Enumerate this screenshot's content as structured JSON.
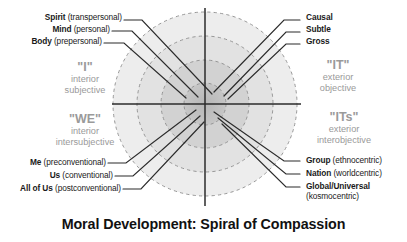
{
  "caption": "Moral Development: Spiral of Compassion",
  "colors": {
    "background": "#ffffff",
    "text": "#1a1a1a",
    "quadrant_label": "#9a9a9a",
    "axis": "#2b2b2b",
    "ring_outer": "#ededed",
    "ring_mid": "#e0e0e0",
    "ring_inner": "#cfcfcf",
    "ring_core": "#bfbfbf",
    "ring_dash": "#8a8a8a"
  },
  "quadrants": {
    "upper_left": {
      "name": "\"I\"",
      "line1": "interior",
      "line2": "subjective"
    },
    "lower_left": {
      "name": "\"WE\"",
      "line1": "interior",
      "line2": "intersubjective"
    },
    "upper_right": {
      "name": "\"IT\"",
      "line1": "exterior",
      "line2": "objective"
    },
    "lower_right": {
      "name": "\"ITs\"",
      "line1": "exterior",
      "line2": "interobjective"
    }
  },
  "labels": {
    "upper_left": [
      {
        "bold": "Spirit",
        "paren": "(transpersonal)"
      },
      {
        "bold": "Mind",
        "paren": "(personal)"
      },
      {
        "bold": "Body",
        "paren": "(prepersonal)"
      }
    ],
    "upper_right": [
      {
        "bold": "Causal",
        "paren": ""
      },
      {
        "bold": "Subtle",
        "paren": ""
      },
      {
        "bold": "Gross",
        "paren": ""
      }
    ],
    "lower_left": [
      {
        "bold": "Me",
        "paren": "(preconventional)"
      },
      {
        "bold": "Us",
        "paren": "(conventional)"
      },
      {
        "bold": "All of Us",
        "paren": "(postconventional)"
      }
    ],
    "lower_right": [
      {
        "bold": "Group",
        "paren": "(ethnocentric)"
      },
      {
        "bold": "Nation",
        "paren": "(worldcentric)"
      },
      {
        "bold": "Global/Universal",
        "paren": "",
        "paren2": "(kosmocentric)"
      }
    ]
  }
}
